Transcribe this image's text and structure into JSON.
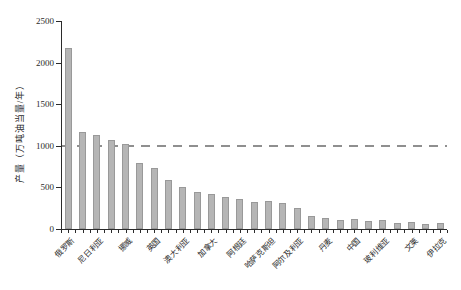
{
  "chart_data": {
    "type": "bar",
    "title": "",
    "xlabel": "",
    "ylabel": "产量（万吨油当量/年）",
    "ylim": [
      0,
      2500
    ],
    "yticks": [
      0,
      500,
      1000,
      1500,
      2000,
      2500
    ],
    "grid": "off",
    "legend": "none",
    "reference_line": {
      "value": 1000,
      "style": "dashed",
      "color": "#8f8f8f"
    },
    "bar_color": "#b5b5b5",
    "bar_edge_color": "#999999",
    "note": "27 bars sorted descending; only every other bar is labeled",
    "categories": [
      "俄罗斯",
      "",
      "尼日利亚",
      "",
      "挪威",
      "",
      "英国",
      "",
      "澳大利亚",
      "",
      "加拿大",
      "",
      "阿根廷",
      "",
      "哈萨克斯坦",
      "",
      "阿尔及利亚",
      "",
      "丹麦",
      "",
      "中国",
      "",
      "玻利维亚",
      "",
      "文莱",
      "",
      "伊拉克"
    ],
    "values": [
      2170,
      1165,
      1130,
      1070,
      1025,
      790,
      730,
      590,
      500,
      445,
      420,
      380,
      360,
      330,
      340,
      310,
      250,
      160,
      135,
      110,
      120,
      95,
      105,
      75,
      85,
      60,
      70
    ],
    "labeled_categories": [
      "俄罗斯",
      "尼日利亚",
      "挪威",
      "英国",
      "澳大利亚",
      "加拿大",
      "阿根廷",
      "哈萨克斯坦",
      "阿尔及利亚",
      "丹麦",
      "中国",
      "玻利维亚",
      "文莱",
      "伊拉克"
    ]
  }
}
